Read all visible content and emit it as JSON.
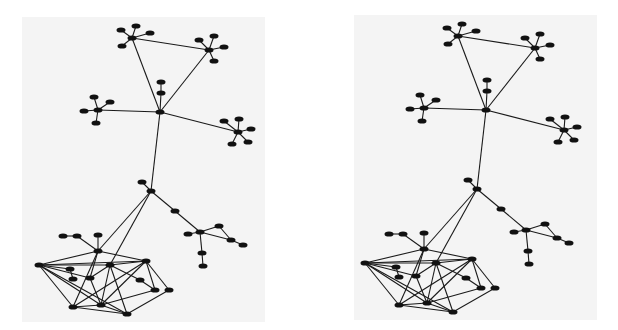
{
  "figure": {
    "type": "network-graph-stereo-pair",
    "panels": [
      {
        "name": "left",
        "x": 22,
        "y": 17,
        "w": 243,
        "h": 305,
        "dx": 0,
        "dy": 0
      },
      {
        "name": "right",
        "x": 354,
        "y": 15,
        "w": 243,
        "h": 305,
        "dx": 326,
        "dy": -2
      }
    ],
    "colors": {
      "background": "#ffffff",
      "panel": "#f4f4f4",
      "node": "#111111",
      "edge": "#1a1a1a"
    },
    "node_rx": 4.5,
    "node_ry": 2.6,
    "nodes": {
      "tl_hub": [
        132,
        38
      ],
      "tl_a": [
        121,
        30
      ],
      "tl_b": [
        136,
        26
      ],
      "tl_c": [
        150,
        33
      ],
      "tl_d": [
        122,
        46
      ],
      "tr_hub": [
        209,
        50
      ],
      "tr_a": [
        199,
        40
      ],
      "tr_b": [
        214,
        36
      ],
      "tr_c": [
        224,
        47
      ],
      "tr_d": [
        214,
        61
      ],
      "center": [
        160,
        112
      ],
      "c_up1": [
        161,
        82
      ],
      "c_up2": [
        161,
        93
      ],
      "l_hub": [
        98,
        110
      ],
      "l_a": [
        94,
        97
      ],
      "l_b": [
        110,
        102
      ],
      "l_c": [
        84,
        111
      ],
      "l_d": [
        96,
        123
      ],
      "r_hub": [
        238,
        132
      ],
      "r_a": [
        224,
        121
      ],
      "r_b": [
        239,
        119
      ],
      "r_c": [
        251,
        129
      ],
      "r_d": [
        248,
        142
      ],
      "r_e": [
        232,
        144
      ],
      "bridge": [
        151,
        191
      ],
      "bridge_leaf": [
        142,
        182
      ],
      "path_mid": [
        175,
        211
      ],
      "lr_hub": [
        200,
        232
      ],
      "lr_left": [
        188,
        234
      ],
      "lr_tri": [
        219,
        226
      ],
      "lr_tri2": [
        231,
        240
      ],
      "lr_end": [
        243,
        245
      ],
      "lr_down1": [
        202,
        253
      ],
      "lr_down2": [
        203,
        266
      ],
      "B": [
        98,
        251
      ],
      "B_up": [
        98,
        235
      ],
      "B_ch1": [
        77,
        236
      ],
      "B_ch2": [
        63,
        236
      ],
      "C": [
        39,
        265
      ],
      "D": [
        110,
        265
      ],
      "E": [
        146,
        261
      ],
      "g1": [
        70,
        269
      ],
      "g2": [
        73,
        279
      ],
      "F": [
        90,
        278
      ],
      "H": [
        140,
        280
      ],
      "I": [
        155,
        290
      ],
      "J": [
        169,
        290
      ],
      "K": [
        73,
        307
      ],
      "L": [
        101,
        305
      ],
      "M": [
        127,
        314
      ]
    },
    "edges": [
      [
        "tl_hub",
        "tl_a"
      ],
      [
        "tl_hub",
        "tl_b"
      ],
      [
        "tl_hub",
        "tl_c"
      ],
      [
        "tl_hub",
        "tl_d"
      ],
      [
        "tr_hub",
        "tr_a"
      ],
      [
        "tr_hub",
        "tr_b"
      ],
      [
        "tr_hub",
        "tr_c"
      ],
      [
        "tr_hub",
        "tr_d"
      ],
      [
        "tl_hub",
        "tr_hub"
      ],
      [
        "tl_hub",
        "center"
      ],
      [
        "tr_hub",
        "center"
      ],
      [
        "center",
        "c_up2"
      ],
      [
        "c_up2",
        "c_up1"
      ],
      [
        "l_hub",
        "l_a"
      ],
      [
        "l_hub",
        "l_b"
      ],
      [
        "l_hub",
        "l_c"
      ],
      [
        "l_hub",
        "l_d"
      ],
      [
        "l_hub",
        "center"
      ],
      [
        "r_hub",
        "r_a"
      ],
      [
        "r_hub",
        "r_b"
      ],
      [
        "r_hub",
        "r_c"
      ],
      [
        "r_hub",
        "r_d"
      ],
      [
        "r_hub",
        "r_e"
      ],
      [
        "r_hub",
        "center"
      ],
      [
        "center",
        "bridge"
      ],
      [
        "bridge",
        "bridge_leaf"
      ],
      [
        "bridge",
        "path_mid"
      ],
      [
        "path_mid",
        "lr_hub"
      ],
      [
        "lr_hub",
        "lr_left"
      ],
      [
        "lr_hub",
        "lr_tri"
      ],
      [
        "lr_tri",
        "lr_tri2"
      ],
      [
        "lr_hub",
        "lr_tri2"
      ],
      [
        "lr_tri2",
        "lr_end"
      ],
      [
        "lr_hub",
        "lr_down1"
      ],
      [
        "lr_down1",
        "lr_down2"
      ],
      [
        "bridge",
        "B"
      ],
      [
        "bridge",
        "D"
      ],
      [
        "B",
        "B_up"
      ],
      [
        "B",
        "B_ch1"
      ],
      [
        "B_ch1",
        "B_ch2"
      ],
      [
        "C",
        "B"
      ],
      [
        "C",
        "D"
      ],
      [
        "C",
        "E"
      ],
      [
        "C",
        "g1"
      ],
      [
        "C",
        "F"
      ],
      [
        "C",
        "K"
      ],
      [
        "C",
        "L"
      ],
      [
        "C",
        "M"
      ],
      [
        "g1",
        "g2"
      ],
      [
        "B",
        "E"
      ],
      [
        "B",
        "F"
      ],
      [
        "B",
        "K"
      ],
      [
        "D",
        "H"
      ],
      [
        "D",
        "L"
      ],
      [
        "D",
        "M"
      ],
      [
        "D",
        "E"
      ],
      [
        "E",
        "K"
      ],
      [
        "E",
        "L"
      ],
      [
        "E",
        "I"
      ],
      [
        "E",
        "J"
      ],
      [
        "F",
        "L"
      ],
      [
        "F",
        "D"
      ],
      [
        "H",
        "I"
      ],
      [
        "I",
        "L"
      ],
      [
        "J",
        "M"
      ],
      [
        "K",
        "M"
      ],
      [
        "L",
        "M"
      ],
      [
        "K",
        "L"
      ]
    ]
  }
}
